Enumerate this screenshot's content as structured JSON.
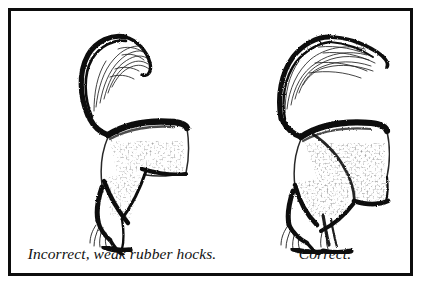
{
  "plate": {
    "title": "Horse hindquarter conformation comparison",
    "border_color": "#0d0d0d",
    "background_color": "#ffffff",
    "ink_color": "#111111"
  },
  "panels": [
    {
      "id": "incorrect",
      "caption": "Incorrect, weak rubber hocks.",
      "subject": "horse-hindquarters-rear-leg"
    },
    {
      "id": "correct",
      "caption": "Correct.",
      "subject": "horse-hindquarters-rear-legs"
    }
  ]
}
